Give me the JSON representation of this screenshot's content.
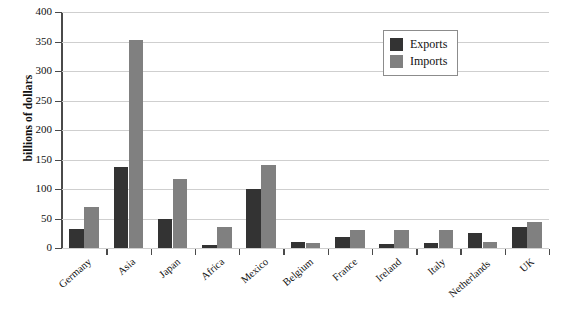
{
  "chart_data": {
    "type": "bar",
    "title": "",
    "xlabel": "",
    "ylabel": "billions of dollars",
    "ylim": [
      0,
      400
    ],
    "yticks": [
      0,
      50,
      100,
      150,
      200,
      250,
      300,
      350,
      400
    ],
    "ytick_labels": [
      "0",
      "50",
      "100",
      "150",
      "200",
      "250",
      "300",
      "350",
      "400"
    ],
    "grid": true,
    "legend_position": "top-right",
    "categories": [
      "Germany",
      "Asia",
      "Japan",
      "Africa",
      "Mexico",
      "Belgium",
      "France",
      "Ireland",
      "Italy",
      "Netherlands",
      "UK"
    ],
    "series": [
      {
        "name": "Exports",
        "color": "#333333",
        "values": [
          33,
          137,
          50,
          5,
          100,
          10,
          18,
          6,
          8,
          25,
          35
        ]
      },
      {
        "name": "Imports",
        "color": "#808080",
        "values": [
          70,
          353,
          117,
          35,
          140,
          8,
          30,
          30,
          30,
          10,
          44
        ]
      }
    ]
  },
  "legend": {
    "items": [
      {
        "label": "Exports",
        "color": "#333333"
      },
      {
        "label": "Imports",
        "color": "#808080"
      }
    ]
  },
  "axes": {
    "y_title": "billions of dollars"
  },
  "colors": {
    "exports": "#333333",
    "imports": "#808080",
    "gridline": "#cfcfcf",
    "axis": "#4a4a4a",
    "legend_border": "#8c8c8c",
    "background": "#ffffff"
  }
}
